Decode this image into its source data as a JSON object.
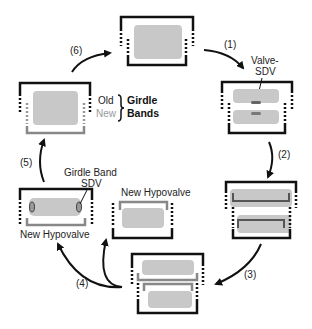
{
  "diagram": {
    "type": "cycle",
    "steps": [
      {
        "id": "1",
        "label": "(1)"
      },
      {
        "id": "2",
        "label": "(2)"
      },
      {
        "id": "3",
        "label": "(3)"
      },
      {
        "id": "4",
        "label": "(4)"
      },
      {
        "id": "5",
        "label": "(5)"
      },
      {
        "id": "6",
        "label": "(6)"
      }
    ],
    "annotations": {
      "valve_sdv_line1": "Valve-",
      "valve_sdv_line2": "SDV",
      "girdle_band_sdv_line1": "Girdle Band",
      "girdle_band_sdv_line2": "SDV",
      "new_hypovalve_left": "New Hypovalve",
      "new_hypovalve_center": "New Hypovalve",
      "legend_old": "Old",
      "legend_new": "New",
      "legend_girdle": "Girdle",
      "legend_bands": "Bands"
    },
    "colors": {
      "frame": "#111111",
      "cell_fill": "#c8c8c8",
      "new_band": "#8a8a8a",
      "background": "#ffffff"
    }
  }
}
